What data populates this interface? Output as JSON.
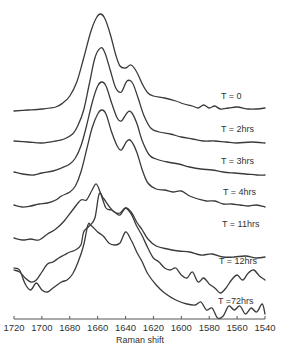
{
  "chart_data": {
    "type": "line",
    "title": "",
    "xlabel": "Raman shift",
    "ylabel": "",
    "xlim": [
      1720,
      1540
    ],
    "x_reversed": true,
    "grid": false,
    "legend_position": "inline-right",
    "x_ticks": [
      1720,
      1700,
      1680,
      1660,
      1640,
      1620,
      1600,
      1580,
      1560,
      1540
    ],
    "y_axis_shown": false,
    "stacked_offset": true,
    "series": [
      {
        "name": "T = 0",
        "label_pos": [
          221,
          99
        ],
        "peaks": [
          {
            "x": 1658,
            "note": "main peak"
          },
          {
            "x": 1640,
            "note": "shoulder"
          }
        ],
        "points": [
          [
            1720,
            111
          ],
          [
            1710,
            110
          ],
          [
            1700,
            109
          ],
          [
            1690,
            107
          ],
          [
            1685,
            103
          ],
          [
            1680,
            96
          ],
          [
            1675,
            82
          ],
          [
            1670,
            58
          ],
          [
            1665,
            32
          ],
          [
            1661,
            18
          ],
          [
            1658,
            14
          ],
          [
            1655,
            18
          ],
          [
            1651,
            34
          ],
          [
            1647,
            55
          ],
          [
            1644,
            66
          ],
          [
            1640,
            68
          ],
          [
            1636,
            65
          ],
          [
            1632,
            72
          ],
          [
            1628,
            84
          ],
          [
            1624,
            93
          ],
          [
            1620,
            96
          ],
          [
            1612,
            98
          ],
          [
            1604,
            101
          ],
          [
            1598,
            104
          ],
          [
            1592,
            106
          ],
          [
            1588,
            108
          ],
          [
            1584,
            105
          ],
          [
            1580,
            108
          ],
          [
            1576,
            106
          ],
          [
            1572,
            109
          ],
          [
            1566,
            108
          ],
          [
            1560,
            107
          ],
          [
            1552,
            109
          ],
          [
            1546,
            109
          ],
          [
            1540,
            108
          ]
        ]
      },
      {
        "name": "T = 2hrs",
        "label_pos": [
          221,
          132
        ],
        "peaks": [
          {
            "x": 1657,
            "note": "main peak"
          },
          {
            "x": 1639,
            "note": "shoulder"
          }
        ],
        "points": [
          [
            1720,
            141
          ],
          [
            1710,
            142
          ],
          [
            1700,
            143
          ],
          [
            1690,
            141
          ],
          [
            1684,
            139
          ],
          [
            1678,
            134
          ],
          [
            1674,
            125
          ],
          [
            1670,
            110
          ],
          [
            1666,
            84
          ],
          [
            1662,
            58
          ],
          [
            1658,
            48
          ],
          [
            1655,
            52
          ],
          [
            1651,
            70
          ],
          [
            1647,
            88
          ],
          [
            1643,
            92
          ],
          [
            1639,
            81
          ],
          [
            1635,
            83
          ],
          [
            1631,
            98
          ],
          [
            1627,
            115
          ],
          [
            1622,
            128
          ],
          [
            1616,
            132
          ],
          [
            1608,
            134
          ],
          [
            1600,
            137
          ],
          [
            1592,
            139
          ],
          [
            1584,
            141
          ],
          [
            1576,
            141
          ],
          [
            1568,
            142
          ],
          [
            1560,
            143
          ],
          [
            1550,
            142
          ],
          [
            1540,
            143
          ]
        ]
      },
      {
        "name": "T = 3hrs",
        "label_pos": [
          221,
          164
        ],
        "peaks": [
          {
            "x": 1657,
            "note": "main peak"
          },
          {
            "x": 1639,
            "note": "shoulder"
          }
        ],
        "points": [
          [
            1720,
            172
          ],
          [
            1714,
            174
          ],
          [
            1706,
            175
          ],
          [
            1700,
            173
          ],
          [
            1692,
            171
          ],
          [
            1686,
            168
          ],
          [
            1680,
            164
          ],
          [
            1676,
            158
          ],
          [
            1672,
            146
          ],
          [
            1668,
            126
          ],
          [
            1664,
            103
          ],
          [
            1660,
            86
          ],
          [
            1657,
            82
          ],
          [
            1654,
            86
          ],
          [
            1650,
            103
          ],
          [
            1646,
            118
          ],
          [
            1643,
            121
          ],
          [
            1639,
            113
          ],
          [
            1636,
            112
          ],
          [
            1632,
            123
          ],
          [
            1628,
            141
          ],
          [
            1623,
            155
          ],
          [
            1618,
            159
          ],
          [
            1610,
            162
          ],
          [
            1602,
            164
          ],
          [
            1594,
            167
          ],
          [
            1586,
            169
          ],
          [
            1578,
            170
          ],
          [
            1570,
            172
          ],
          [
            1562,
            173
          ],
          [
            1554,
            174
          ],
          [
            1546,
            175
          ],
          [
            1540,
            175
          ]
        ]
      },
      {
        "name": "T = 4hrs",
        "label_pos": [
          223,
          195
        ],
        "peaks": [
          {
            "x": 1656,
            "note": "main peak"
          },
          {
            "x": 1639,
            "note": "shoulder"
          }
        ],
        "points": [
          [
            1720,
            205
          ],
          [
            1714,
            207
          ],
          [
            1708,
            206
          ],
          [
            1702,
            204
          ],
          [
            1696,
            203
          ],
          [
            1690,
            200
          ],
          [
            1686,
            196
          ],
          [
            1680,
            192
          ],
          [
            1676,
            186
          ],
          [
            1672,
            172
          ],
          [
            1668,
            150
          ],
          [
            1664,
            128
          ],
          [
            1660,
            114
          ],
          [
            1657,
            110
          ],
          [
            1654,
            114
          ],
          [
            1650,
            132
          ],
          [
            1646,
            146
          ],
          [
            1643,
            150
          ],
          [
            1639,
            141
          ],
          [
            1636,
            141
          ],
          [
            1632,
            152
          ],
          [
            1628,
            170
          ],
          [
            1624,
            183
          ],
          [
            1618,
            189
          ],
          [
            1612,
            190
          ],
          [
            1606,
            192
          ],
          [
            1600,
            191
          ],
          [
            1594,
            196
          ],
          [
            1588,
            199
          ],
          [
            1582,
            201
          ],
          [
            1576,
            201
          ],
          [
            1570,
            204
          ],
          [
            1564,
            204
          ],
          [
            1558,
            205
          ],
          [
            1552,
            206
          ],
          [
            1546,
            205
          ],
          [
            1540,
            207
          ]
        ]
      },
      {
        "name": "T = 11hrs",
        "label_pos": [
          222,
          227
        ],
        "peaks": [
          {
            "x": 1658,
            "note": "main peak"
          },
          {
            "x": 1640,
            "note": "shoulder"
          }
        ],
        "points": [
          [
            1720,
            238
          ],
          [
            1714,
            240
          ],
          [
            1708,
            239
          ],
          [
            1702,
            240
          ],
          [
            1696,
            234
          ],
          [
            1690,
            229
          ],
          [
            1684,
            221
          ],
          [
            1678,
            210
          ],
          [
            1672,
            200
          ],
          [
            1668,
            200
          ],
          [
            1664,
            190
          ],
          [
            1661,
            184
          ],
          [
            1658,
            193
          ],
          [
            1654,
            208
          ],
          [
            1650,
            210
          ],
          [
            1647,
            213
          ],
          [
            1644,
            215
          ],
          [
            1640,
            208
          ],
          [
            1636,
            212
          ],
          [
            1632,
            222
          ],
          [
            1628,
            230
          ],
          [
            1624,
            239
          ],
          [
            1618,
            246
          ],
          [
            1610,
            249
          ],
          [
            1602,
            251
          ],
          [
            1594,
            252
          ],
          [
            1586,
            255
          ],
          [
            1578,
            254
          ],
          [
            1570,
            257
          ],
          [
            1562,
            257
          ],
          [
            1554,
            256
          ],
          [
            1546,
            258
          ],
          [
            1540,
            257
          ]
        ]
      },
      {
        "name": "T = 12hrs",
        "label_pos": [
          219,
          264
        ],
        "peaks": [
          {
            "x": 1659,
            "note": "main peak"
          },
          {
            "x": 1640,
            "note": "shoulder"
          }
        ],
        "points": [
          [
            1720,
            270
          ],
          [
            1716,
            272
          ],
          [
            1712,
            278
          ],
          [
            1708,
            282
          ],
          [
            1704,
            280
          ],
          [
            1700,
            272
          ],
          [
            1696,
            264
          ],
          [
            1692,
            262
          ],
          [
            1688,
            258
          ],
          [
            1684,
            255
          ],
          [
            1680,
            252
          ],
          [
            1676,
            250
          ],
          [
            1672,
            245
          ],
          [
            1670,
            232
          ],
          [
            1666,
            226
          ],
          [
            1662,
            218
          ],
          [
            1659,
            194
          ],
          [
            1656,
            198
          ],
          [
            1652,
            206
          ],
          [
            1648,
            212
          ],
          [
            1644,
            213
          ],
          [
            1640,
            208
          ],
          [
            1636,
            214
          ],
          [
            1632,
            226
          ],
          [
            1628,
            236
          ],
          [
            1624,
            248
          ],
          [
            1620,
            258
          ],
          [
            1616,
            262
          ],
          [
            1612,
            268
          ],
          [
            1608,
            270
          ],
          [
            1604,
            268
          ],
          [
            1600,
            275
          ],
          [
            1596,
            278
          ],
          [
            1592,
            272
          ],
          [
            1588,
            282
          ],
          [
            1584,
            278
          ],
          [
            1580,
            284
          ],
          [
            1576,
            288
          ],
          [
            1572,
            293
          ],
          [
            1568,
            288
          ],
          [
            1564,
            280
          ],
          [
            1560,
            275
          ],
          [
            1556,
            280
          ],
          [
            1552,
            273
          ],
          [
            1548,
            270
          ],
          [
            1544,
            276
          ],
          [
            1540,
            280
          ]
        ]
      },
      {
        "name": "T =72hrs",
        "label_pos": [
          218,
          304
        ],
        "peaks": [
          {
            "x": 1668,
            "note": "broad main peak"
          },
          {
            "x": 1640,
            "note": "shoulder"
          }
        ],
        "points": [
          [
            1720,
            268
          ],
          [
            1716,
            270
          ],
          [
            1712,
            284
          ],
          [
            1708,
            290
          ],
          [
            1704,
            283
          ],
          [
            1700,
            290
          ],
          [
            1696,
            292
          ],
          [
            1692,
            288
          ],
          [
            1686,
            282
          ],
          [
            1682,
            280
          ],
          [
            1678,
            274
          ],
          [
            1674,
            262
          ],
          [
            1670,
            245
          ],
          [
            1667,
            225
          ],
          [
            1665,
            225
          ],
          [
            1660,
            232
          ],
          [
            1656,
            236
          ],
          [
            1652,
            243
          ],
          [
            1648,
            245
          ],
          [
            1644,
            243
          ],
          [
            1640,
            232
          ],
          [
            1636,
            240
          ],
          [
            1632,
            252
          ],
          [
            1628,
            262
          ],
          [
            1624,
            274
          ],
          [
            1618,
            285
          ],
          [
            1612,
            293
          ],
          [
            1604,
            300
          ],
          [
            1596,
            304
          ],
          [
            1590,
            305
          ],
          [
            1586,
            302
          ],
          [
            1582,
            310
          ],
          [
            1578,
            308
          ],
          [
            1574,
            318
          ],
          [
            1570,
            316
          ],
          [
            1566,
            306
          ],
          [
            1562,
            310
          ],
          [
            1558,
            306
          ],
          [
            1554,
            314
          ],
          [
            1550,
            308
          ],
          [
            1546,
            312
          ],
          [
            1542,
            304
          ],
          [
            1540,
            314
          ]
        ]
      }
    ]
  },
  "axis": {
    "xlabel": "Raman shift",
    "ticks": [
      "1720",
      "1700",
      "1680",
      "1660",
      "1640",
      "1620",
      "1600",
      "1580",
      "1560",
      "1540"
    ]
  },
  "labels": [
    "T = 0",
    "T = 2hrs",
    "T = 3hrs",
    "T = 4hrs",
    "T = 11hrs",
    "T = 12hrs",
    "T =72hrs"
  ]
}
